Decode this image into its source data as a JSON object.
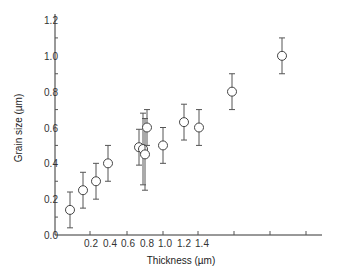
{
  "chart_data": {
    "type": "scatter",
    "title": "",
    "xlabel": "Thickness (µm)",
    "ylabel": "Grain size (µm)",
    "ylim": [
      0.0,
      1.2
    ],
    "xlim": [
      0.0,
      1.5
    ],
    "grid": false,
    "legend": null,
    "y_ticks": [
      "0.0",
      "0.2",
      "0.4",
      "0.6",
      "0.8",
      "1.0",
      "1.2"
    ],
    "x_ticks": [
      "0.2",
      "0.4",
      "0.6",
      "0.8",
      "1.0",
      "1.2",
      "1.4"
    ],
    "series": [
      {
        "name": "Grain size vs thickness",
        "marker": "open-circle",
        "error_bars": true,
        "points": [
          {
            "px": 70,
            "y": 0.14,
            "err_low": 0.1,
            "err_high": 0.1
          },
          {
            "px": 83,
            "y": 0.25,
            "err_low": 0.1,
            "err_high": 0.1
          },
          {
            "px": 96,
            "y": 0.3,
            "err_low": 0.1,
            "err_high": 0.1
          },
          {
            "px": 108,
            "y": 0.4,
            "err_low": 0.1,
            "err_high": 0.1
          },
          {
            "px": 139,
            "y": 0.49,
            "err_low": 0.1,
            "err_high": 0.1
          },
          {
            "px": 143,
            "y": 0.48,
            "err_low": 0.2,
            "err_high": 0.2
          },
          {
            "px": 145,
            "y": 0.45,
            "err_low": 0.2,
            "err_high": 0.2
          },
          {
            "px": 147,
            "y": 0.6,
            "err_low": 0.1,
            "err_high": 0.1
          },
          {
            "px": 163,
            "y": 0.5,
            "err_low": 0.1,
            "err_high": 0.1
          },
          {
            "px": 184,
            "y": 0.63,
            "err_low": 0.1,
            "err_high": 0.1
          },
          {
            "px": 199,
            "y": 0.6,
            "err_low": 0.1,
            "err_high": 0.1
          },
          {
            "px": 232,
            "y": 0.8,
            "err_low": 0.1,
            "err_high": 0.1
          },
          {
            "px": 282,
            "y": 1.0,
            "err_low": 0.1,
            "err_high": 0.1
          }
        ]
      }
    ]
  }
}
